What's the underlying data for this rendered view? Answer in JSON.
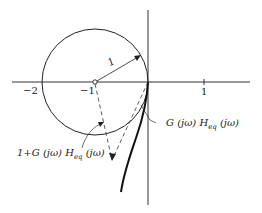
{
  "figure": {
    "type": "nyquist-diagram",
    "axis_labels": {
      "minus_two": "−2",
      "minus_one": "−1",
      "one": "1"
    },
    "radius_label": "1",
    "open_loop_label": {
      "prefix": "G (jω) H",
      "sub": "eq",
      "suffix": " (jω)"
    },
    "closed_loop_label": {
      "prefix": "1+G (jω) H",
      "sub": "eq",
      "suffix": " (jω)"
    },
    "colors": {
      "ink": "#222222",
      "background": "#ffffff"
    }
  }
}
